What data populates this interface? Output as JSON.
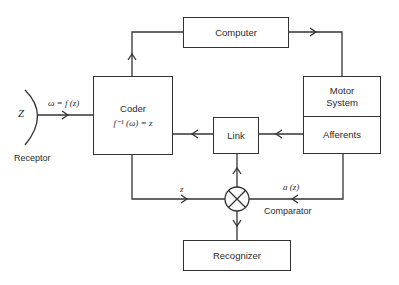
{
  "diagram": {
    "boxes": {
      "computer": "Computer",
      "coder": "Coder",
      "coder_formula": "f⁻¹ (ω) = z",
      "motor": "Motor System",
      "motor_line1": "Motor",
      "motor_line2": "System",
      "afferents": "Afferents",
      "link": "Link",
      "recognizer": "Recognizer"
    },
    "labels": {
      "z_input": "Z",
      "receptor": "Receptor",
      "omega": "ω = f (z)",
      "z_signal": "z",
      "a_z": "a (z)",
      "comparator": "Comparator"
    },
    "connections": [
      {
        "from": "receptor",
        "to": "coder",
        "label": "ω = f (z)"
      },
      {
        "from": "coder",
        "to": "computer"
      },
      {
        "from": "computer",
        "to": "motor"
      },
      {
        "from": "afferents",
        "to": "link"
      },
      {
        "from": "link",
        "to": "coder"
      },
      {
        "from": "coder",
        "to": "comparator",
        "label": "z"
      },
      {
        "from": "afferents",
        "to": "comparator",
        "label": "a (z)"
      },
      {
        "from": "comparator",
        "to": "link"
      },
      {
        "from": "comparator",
        "to": "recognizer"
      }
    ]
  }
}
